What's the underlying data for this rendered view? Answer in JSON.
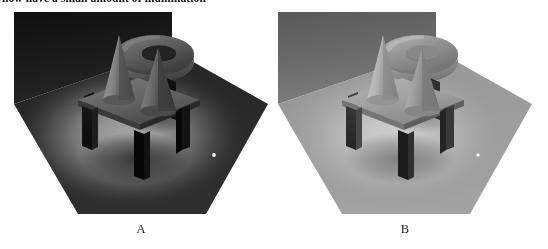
{
  "document": {
    "caption_clipped": "now have a small amount of illumination"
  },
  "figure": {
    "panels": [
      {
        "id": "A",
        "label": "A",
        "name": "render-panel-a",
        "description": "Rendered 3D scene, direct illumination only, dark surroundings",
        "illumination": "direct-only",
        "colors": {
          "back_wall_top": "#151515",
          "back_wall_bottom": "#232323",
          "ground_ambient": "#2a2a2a",
          "ground_pool_center": "#9a9a9a",
          "ground_pool_mid": "#6c6c6c",
          "ground_pool_edge": "#323232",
          "table_top": "#6e6e6e",
          "table_side": "#2b2b2b",
          "table_leg_front": "#101010",
          "table_leg_side": "#1c1c1c",
          "cone_lit": "#8e8e8e",
          "cone_shade": "#4a4a4a",
          "torus_lit": "#6a6a6a",
          "torus_shade": "#3b3b3b",
          "specular_dot": "#f2f2f2"
        }
      },
      {
        "id": "B",
        "label": "B",
        "name": "render-panel-b",
        "description": "Rendered 3D scene, direct plus ambient illumination, brighter surroundings",
        "illumination": "direct-plus-ambient",
        "colors": {
          "back_wall_top": "#5e5e5e",
          "back_wall_bottom": "#7a7a7a",
          "ground_ambient": "#9a9a9a",
          "ground_pool_center": "#c4c4c4",
          "ground_pool_mid": "#b0b0b0",
          "ground_pool_edge": "#9d9d9d",
          "table_top": "#a6a6a6",
          "table_side": "#6e6e6e",
          "table_leg_front": "#2a2a2a",
          "table_leg_side": "#3e3e3e",
          "cone_lit": "#bdbdbd",
          "cone_shade": "#7d7d7d",
          "torus_lit": "#9c9c9c",
          "torus_shade": "#6d6d6d",
          "specular_dot": "#f6f6f6"
        }
      }
    ],
    "scene_objects": [
      "back-wall",
      "ground-plane",
      "light-pool",
      "floating-torus",
      "table",
      "table-leg-front-left",
      "table-leg-front-right",
      "table-leg-back-left",
      "table-leg-back-right",
      "cone-left",
      "cone-right",
      "table-shadow",
      "torus-shadow"
    ]
  }
}
